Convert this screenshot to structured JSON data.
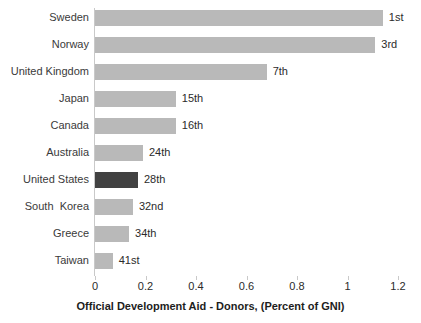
{
  "chart_data": {
    "type": "bar",
    "orientation": "horizontal",
    "title": "",
    "xlabel": "Official Development Aid - Donors, (Percent of GNI)",
    "ylabel": "",
    "xlim": [
      0,
      1.2
    ],
    "xticks": [
      "0",
      "0.2",
      "0.4",
      "0.6",
      "0.8",
      "1",
      "1.2"
    ],
    "xtick_values": [
      0,
      0.2,
      0.4,
      0.6,
      0.8,
      1,
      1.2
    ],
    "grid": false,
    "legend": "none",
    "categories": [
      "Sweden",
      "Norway",
      "United Kingdom",
      "Japan",
      "Canada",
      "Australia",
      "United States",
      "South  Korea",
      "Greece",
      "Taiwan"
    ],
    "values": [
      1.14,
      1.11,
      0.68,
      0.32,
      0.32,
      0.19,
      0.17,
      0.15,
      0.135,
      0.07
    ],
    "data_labels": [
      "1st",
      "3rd",
      "7th",
      "15th",
      "16th",
      "24th",
      "28th",
      "32nd",
      "34th",
      "41st"
    ],
    "highlighted_category": "United States",
    "colors": {
      "bar": "#b9b9b9",
      "bar_highlight": "#414141",
      "axis": "#c9c9c9",
      "text": "#2b2b2b",
      "background": "#ffffff"
    }
  }
}
